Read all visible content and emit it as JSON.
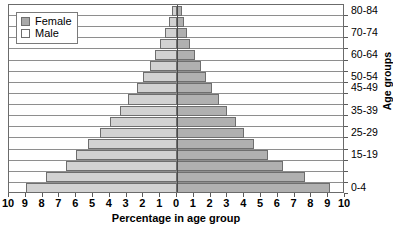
{
  "chart_data": {
    "type": "bar",
    "subtype": "population-pyramid",
    "title": "",
    "xlabel": "Percentage in age group",
    "ylabel": "Age groups",
    "grid": true,
    "legend_position": "top-left",
    "xlim": [
      -10,
      10
    ],
    "xtick_labels": [
      "10",
      "9",
      "8",
      "7",
      "6",
      "5",
      "4",
      "3",
      "2",
      "1",
      "0",
      "1",
      "2",
      "3",
      "4",
      "5",
      "6",
      "7",
      "8",
      "9",
      "10"
    ],
    "xtick_values": [
      -10,
      -9,
      -8,
      -7,
      -6,
      -5,
      -4,
      -3,
      -2,
      -1,
      0,
      1,
      2,
      3,
      4,
      5,
      6,
      7,
      8,
      9,
      10
    ],
    "categories": [
      "0-4",
      "5-9",
      "10-14",
      "15-19",
      "20-24",
      "25-29",
      "30-34",
      "35-39",
      "40-44",
      "45-49",
      "50-54",
      "55-59",
      "60-64",
      "65-69",
      "70-74",
      "75-79",
      "80-84"
    ],
    "visible_category_labels": [
      "0-4",
      "15-19",
      "25-29",
      "35-39",
      "45-49",
      "50-54",
      "60-64",
      "70-74",
      "80-84"
    ],
    "series": [
      {
        "name": "Female",
        "color": "#d2d2d2",
        "side": "left",
        "values": [
          9.0,
          7.8,
          6.6,
          6.0,
          5.3,
          4.6,
          4.0,
          3.4,
          2.9,
          2.4,
          2.0,
          1.6,
          1.3,
          1.0,
          0.7,
          0.5,
          0.3
        ]
      },
      {
        "name": "Male",
        "color": "#b0b0b0",
        "side": "right",
        "values": [
          9.1,
          7.6,
          6.3,
          5.4,
          4.6,
          4.0,
          3.5,
          3.0,
          2.5,
          2.1,
          1.7,
          1.4,
          1.1,
          0.8,
          0.6,
          0.4,
          0.3
        ]
      }
    ]
  },
  "legend": {
    "items": [
      {
        "label": "Female",
        "swatch": "female-swatch"
      },
      {
        "label": "Male",
        "swatch": "male-swatch"
      }
    ]
  }
}
